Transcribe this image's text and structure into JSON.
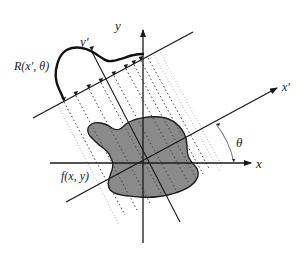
{
  "diagram": {
    "labels": {
      "y_axis": "y",
      "x_axis": "x",
      "x_prime_axis": "x′",
      "y_prime_axis": "y′",
      "projection": "R(x′, θ)",
      "object": "f(x, y)",
      "angle": "θ"
    },
    "colors": {
      "line": "#1a1a1a",
      "object_fill": "#8a8a8a",
      "ray": "#555555",
      "angle_arc": "#777777"
    }
  }
}
